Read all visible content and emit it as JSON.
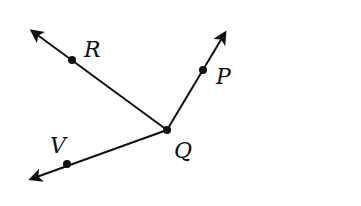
{
  "diagram": {
    "type": "angles-rays",
    "vertex": {
      "label": "Q",
      "x": 167,
      "y": 130
    },
    "rays": [
      {
        "name": "QR",
        "point": {
          "label": "R",
          "x": 72,
          "y": 60
        },
        "tip": {
          "x": 30,
          "y": 29
        }
      },
      {
        "name": "QP",
        "point": {
          "label": "P",
          "x": 203,
          "y": 70
        },
        "tip": {
          "x": 227,
          "y": 30
        }
      },
      {
        "name": "QV",
        "point": {
          "label": "V",
          "x": 67,
          "y": 164
        },
        "tip": {
          "x": 28,
          "y": 180
        }
      }
    ],
    "labels": {
      "R": "R",
      "P": "P",
      "Q": "Q",
      "V": "V"
    },
    "colors": {
      "stroke": "#111111",
      "background": "#ffffff"
    }
  }
}
